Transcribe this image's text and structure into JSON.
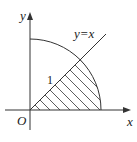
{
  "diagram": {
    "axis_x_label": "x",
    "axis_y_label": "y",
    "origin_label": "O",
    "line_label": "y=x",
    "radius_label": "1",
    "shaded_region": "sector between y=x and x-axis inside unit circle"
  }
}
